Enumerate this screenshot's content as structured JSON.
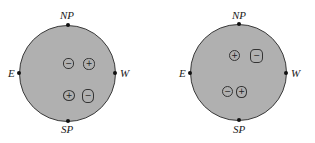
{
  "panels": [
    {
      "labels": {
        "north": "NP",
        "south": "SP",
        "east": "E",
        "west": "W"
      },
      "spots": [
        {
          "sign": "−",
          "polarity": "negative",
          "x": 63,
          "y": 58,
          "w": 11,
          "h": 11,
          "radius": "45%"
        },
        {
          "sign": "+",
          "polarity": "positive",
          "x": 83,
          "y": 58,
          "w": 12,
          "h": 12,
          "radius": "45%"
        },
        {
          "sign": "+",
          "polarity": "positive",
          "x": 63,
          "y": 90,
          "w": 12,
          "h": 11,
          "radius": "50%"
        },
        {
          "sign": "−",
          "polarity": "negative",
          "x": 82,
          "y": 89,
          "w": 12,
          "h": 14,
          "radius": "40%"
        }
      ]
    },
    {
      "labels": {
        "north": "NP",
        "south": "SP",
        "east": "E",
        "west": "W"
      },
      "spots": [
        {
          "sign": "+",
          "polarity": "positive",
          "x": 229,
          "y": 50,
          "w": 11,
          "h": 11,
          "radius": "50%"
        },
        {
          "sign": "−",
          "polarity": "negative",
          "x": 250,
          "y": 49,
          "w": 13,
          "h": 14,
          "radius": "35%"
        },
        {
          "sign": "−",
          "polarity": "negative",
          "x": 222,
          "y": 86,
          "w": 11,
          "h": 11,
          "radius": "50%"
        },
        {
          "sign": "+",
          "polarity": "positive",
          "x": 236,
          "y": 86,
          "w": 11,
          "h": 12,
          "radius": "45%"
        }
      ]
    }
  ]
}
